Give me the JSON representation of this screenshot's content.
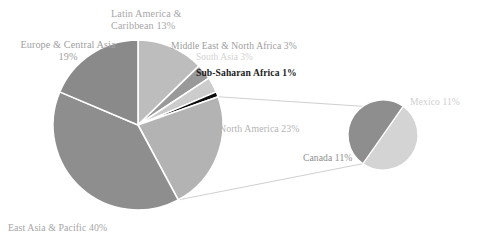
{
  "chart_data": {
    "type": "pie",
    "title": "",
    "subtitle": "",
    "xlabel": "",
    "ylabel": "",
    "legend": "none (direct labels)",
    "grid": false,
    "charts": [
      {
        "name": "main-pie",
        "center": [
          138,
          125
        ],
        "radius": 85,
        "start_angle_deg": -90,
        "direction": "clockwise",
        "categories": [
          "Latin America & Caribbean",
          "Middle East & North Africa",
          "South Asia",
          "Sub-Saharan Africa",
          "North America",
          "East Asia & Pacific",
          "Europe & Central Asia"
        ],
        "values": [
          13,
          3,
          3,
          1,
          23,
          40,
          19
        ],
        "units": "%",
        "colors": [
          "#bdbdbd",
          "#999999",
          "#cccccc",
          "#0d0d0d",
          "#b3b3b3",
          "#8e8e8e",
          "#8a8a8a"
        ]
      },
      {
        "name": "exploded-pie-north-america",
        "center": [
          383,
          135
        ],
        "radius": 35,
        "start_angle_deg": -55,
        "direction": "clockwise",
        "categories": [
          "Mexico",
          "Canada"
        ],
        "values": [
          11,
          11
        ],
        "units": "%",
        "colors": [
          "#d4d4d4",
          "#8e8e8e"
        ]
      }
    ]
  },
  "labels": {
    "latin_america": "Latin America &\nCaribbean 13%",
    "europe_central_asia": "Europe & Central Asia\n19%",
    "middle_east_north_africa": "Middle East & North Africa 3%",
    "south_asia": "South Asia 3%",
    "sub_saharan_africa": "Sub-Saharan Africa 1%",
    "north_america": "North America 23%",
    "east_asia_pacific": "East Asia & Pacific 40%",
    "mexico": "Mexico 11%",
    "canada": "Canada 11%"
  },
  "colors": {
    "latin_america": "#bdbdbd",
    "europe_central_asia": "#8a8a8a",
    "middle_east_north_africa": "#999999",
    "south_asia": "#cccccc",
    "sub_saharan_africa": "#0d0d0d",
    "north_america": "#b3b3b3",
    "east_asia_pacific": "#8e8e8e",
    "mexico": "#d4d4d4",
    "canada": "#8e8e8e",
    "background": "#ffffff",
    "leader_line": "#c9c9c9",
    "slice_divider": "#ffffff"
  }
}
